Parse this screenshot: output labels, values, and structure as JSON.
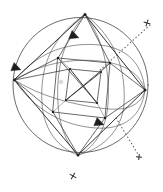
{
  "figure": {
    "title": "Spherical geometric construction",
    "background_color": "#ffffff",
    "ink_color": "#3a3a3a",
    "accent_color": "#1e1e1e",
    "canvas": {
      "width": 163,
      "height": 192
    }
  },
  "chart_data": {
    "type": "diagram",
    "title": "Spherical geometric construction",
    "xlabel": "",
    "ylabel": "",
    "grid": false,
    "legend": "none",
    "xlim": [
      0,
      163
    ],
    "ylim": [
      0,
      192
    ],
    "sphere": {
      "label": "outer-circle",
      "center": [
        80.5,
        85.0
      ],
      "radius": 67.5
    },
    "diamond": {
      "label": "inscribed-quadrilateral",
      "vertices": [
        {
          "name": "top",
          "x": 85.0,
          "y": 14.5
        },
        {
          "name": "right",
          "x": 145.0,
          "y": 90.0
        },
        {
          "name": "bottom",
          "x": 78.0,
          "y": 155.0
        },
        {
          "name": "left",
          "x": 14.5,
          "y": 80.0
        }
      ]
    },
    "inner_quadrilateral": {
      "label": "inner-quadrilateral",
      "vertices": [
        {
          "name": "nw",
          "x": 58.0,
          "y": 58.0
        },
        {
          "name": "ne",
          "x": 110.0,
          "y": 63.0
        },
        {
          "name": "se",
          "x": 105.0,
          "y": 118.0
        },
        {
          "name": "sw",
          "x": 53.0,
          "y": 112.0
        }
      ]
    },
    "core_quadrilateral": {
      "label": "core-quadrilateral",
      "vertices": [
        {
          "name": "nw",
          "x": 70.0,
          "y": 69.0
        },
        {
          "name": "ne",
          "x": 101.0,
          "y": 72.0
        },
        {
          "name": "se",
          "x": 97.0,
          "y": 103.0
        },
        {
          "name": "sw",
          "x": 66.0,
          "y": 100.0
        }
      ]
    },
    "arc_markers": [
      {
        "name": "arrow-upper",
        "x": 74.0,
        "y": 36.0,
        "rotation": 200,
        "direction": "left"
      },
      {
        "name": "arrow-left",
        "x": 16.0,
        "y": 68.0,
        "rotation": 200,
        "direction": "up-left"
      },
      {
        "name": "arrow-lower",
        "x": 99.0,
        "y": 123.0,
        "rotation": 200,
        "direction": "left"
      }
    ],
    "dotted_line": {
      "name": "axis-ray",
      "from": [
        152.0,
        24.0
      ],
      "to": [
        139.0,
        158.0
      ],
      "via": [
        70.0,
        95.0
      ],
      "style": "dotted"
    },
    "cross_marks": [
      {
        "name": "cross-top-right",
        "x": 147.0,
        "y": 23.0,
        "rotation": 18,
        "size": 7.0
      },
      {
        "name": "cross-bottom-right",
        "x": 139.0,
        "y": 157.0,
        "rotation": 6,
        "size": 6.0
      },
      {
        "name": "cross-bottom-center",
        "x": 73.0,
        "y": 176.0,
        "rotation": 30,
        "size": 7.5
      }
    ],
    "arc_families": [
      {
        "name": "meridian-outer-left",
        "description": "great circle arc bowing left"
      },
      {
        "name": "meridian-outer-right",
        "description": "great circle arc bowing right"
      },
      {
        "name": "meridian-inner-left",
        "description": "inner meridian arc"
      },
      {
        "name": "meridian-inner-right",
        "description": "inner meridian arc"
      },
      {
        "name": "parallel-upper",
        "description": "latitude arc upper"
      },
      {
        "name": "parallel-middle",
        "description": "latitude arc middle"
      },
      {
        "name": "parallel-lower",
        "description": "latitude arc lower"
      }
    ],
    "vertex_dots": [
      {
        "x": 85.0,
        "y": 14.5
      },
      {
        "x": 145.0,
        "y": 90.0
      },
      {
        "x": 78.0,
        "y": 155.0
      },
      {
        "x": 14.5,
        "y": 80.0
      },
      {
        "x": 58.0,
        "y": 58.0
      },
      {
        "x": 110.0,
        "y": 63.0
      },
      {
        "x": 105.0,
        "y": 118.0
      },
      {
        "x": 53.0,
        "y": 112.0
      },
      {
        "x": 70.0,
        "y": 69.0
      },
      {
        "x": 101.0,
        "y": 72.0
      },
      {
        "x": 97.0,
        "y": 103.0
      },
      {
        "x": 66.0,
        "y": 100.0
      }
    ]
  }
}
